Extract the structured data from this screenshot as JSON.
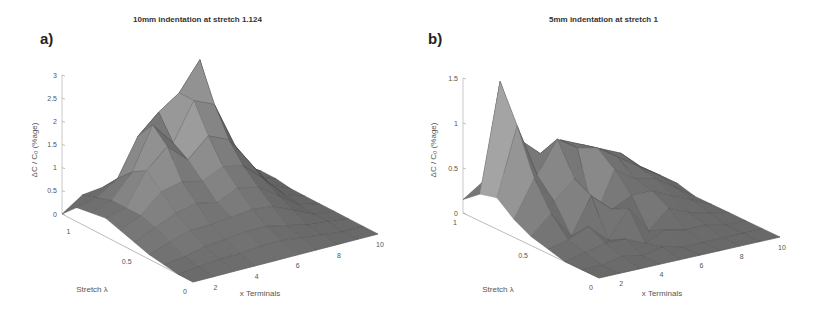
{
  "figure": {
    "panels": [
      {
        "label": "a)",
        "title": "10mm indentation at stretch 1.124",
        "zlabel": "ΔC / C₀ (%age)",
        "xlabel": "x Terminals",
        "ylabel": "Stretch λ"
      },
      {
        "label": "b)",
        "title": "5mm indentation at stretch 1",
        "zlabel": "ΔC / C₀ (%age)",
        "xlabel": "x Terminals",
        "ylabel": "Stretch λ"
      }
    ]
  },
  "chart_data": [
    {
      "type": "surface",
      "title": "10mm indentation at stretch 1.124",
      "panel_label": "a)",
      "xlabel": "x Terminals",
      "ylabel": "Stretch λ",
      "zlabel": "ΔC / C0 (%age)",
      "x_ticks": [
        2,
        4,
        6,
        8,
        10
      ],
      "y_ticks": [
        0,
        0.5,
        1
      ],
      "z_ticks": [
        0,
        0.5,
        1,
        1.5,
        2,
        2.5,
        3
      ],
      "xlim": [
        1,
        10
      ],
      "ylim": [
        0,
        1.124
      ],
      "zlim": [
        0,
        3
      ],
      "grid": false,
      "shading": "grayscale faceted",
      "x": [
        1,
        2,
        3,
        4,
        5,
        6,
        7,
        8,
        9,
        10
      ],
      "y": [
        1.124,
        1.0,
        0.875,
        0.75,
        0.625,
        0.5,
        0.375,
        0.25,
        0.125,
        0
      ],
      "z": [
        [
          0.0,
          0.3,
          0.35,
          0.4,
          0.5,
          0.6,
          0.5,
          0.3,
          0.15,
          0.0
        ],
        [
          0.3,
          0.4,
          0.7,
          1.5,
          1.9,
          2.2,
          2.8,
          1.2,
          0.3,
          0.05
        ],
        [
          0.35,
          0.5,
          1.0,
          1.9,
          1.4,
          2.2,
          2.0,
          1.0,
          0.2,
          0.05
        ],
        [
          0.4,
          0.5,
          1.2,
          1.6,
          1.2,
          1.6,
          1.4,
          0.8,
          0.2,
          0.0
        ],
        [
          0.3,
          0.5,
          0.9,
          1.0,
          0.9,
          1.1,
          1.0,
          0.6,
          0.15,
          0.0
        ],
        [
          0.2,
          0.4,
          0.6,
          0.7,
          0.6,
          0.8,
          0.7,
          0.4,
          0.1,
          0.0
        ],
        [
          0.1,
          0.25,
          0.4,
          0.4,
          0.45,
          0.5,
          0.45,
          0.25,
          0.05,
          0.0
        ],
        [
          0.05,
          0.1,
          0.2,
          0.25,
          0.3,
          0.3,
          0.2,
          0.1,
          0.05,
          0.0
        ],
        [
          0.0,
          0.05,
          0.1,
          0.1,
          0.15,
          0.15,
          0.1,
          0.05,
          0.0,
          0.0
        ],
        [
          0.0,
          0.0,
          0.0,
          0.0,
          0.0,
          0.0,
          0.0,
          0.0,
          0.0,
          0.0
        ]
      ]
    },
    {
      "type": "surface",
      "title": "5mm indentation at stretch 1",
      "panel_label": "b)",
      "xlabel": "x Terminals",
      "ylabel": "Stretch λ",
      "zlabel": "ΔC / C0 (%age)",
      "x_ticks": [
        2,
        4,
        6,
        8,
        10
      ],
      "y_ticks": [
        0,
        0.5,
        1
      ],
      "z_ticks": [
        0,
        0.5,
        1,
        1.5
      ],
      "xlim": [
        1,
        10
      ],
      "ylim": [
        0,
        1
      ],
      "zlim": [
        0,
        1.5
      ],
      "grid": false,
      "shading": "grayscale faceted",
      "x": [
        1,
        2,
        3,
        4,
        5,
        6,
        7,
        8,
        9,
        10
      ],
      "y": [
        1.0,
        0.875,
        0.75,
        0.625,
        0.5,
        0.375,
        0.25,
        0.125,
        0
      ],
      "z": [
        [
          0.15,
          0.3,
          0.35,
          0.3,
          0.3,
          0.25,
          0.2,
          0.15,
          0.1,
          0.0
        ],
        [
          0.3,
          1.5,
          0.8,
          0.6,
          0.7,
          0.6,
          0.5,
          0.4,
          0.2,
          0.05
        ],
        [
          0.35,
          1.1,
          0.5,
          0.85,
          0.7,
          0.65,
          0.5,
          0.35,
          0.2,
          0.05
        ],
        [
          0.2,
          0.6,
          0.3,
          0.5,
          0.0,
          0.5,
          0.35,
          0.3,
          0.15,
          0.0
        ],
        [
          0.1,
          0.3,
          0.0,
          0.4,
          0.2,
          0.3,
          0.3,
          0.2,
          0.1,
          0.0
        ],
        [
          0.05,
          0.1,
          0.2,
          0.0,
          0.3,
          0.0,
          0.2,
          0.1,
          0.05,
          0.0
        ],
        [
          0.0,
          0.05,
          0.1,
          0.1,
          0.0,
          0.1,
          0.05,
          0.05,
          0.0,
          0.0
        ],
        [
          0.0,
          0.0,
          0.05,
          0.0,
          0.05,
          0.0,
          0.0,
          0.0,
          0.0,
          0.0
        ],
        [
          0.0,
          0.0,
          0.0,
          0.0,
          0.0,
          0.0,
          0.0,
          0.0,
          0.0,
          0.0
        ]
      ]
    }
  ],
  "geometry": [
    {
      "origin": [
        62,
        214
      ],
      "y0_corner": [
        193,
        282
      ],
      "x10_corner": [
        378,
        234
      ],
      "z_top": [
        62,
        75
      ]
    },
    {
      "origin": [
        463,
        213
      ],
      "y0_corner": [
        599,
        278
      ],
      "x10_corner": [
        780,
        237
      ],
      "z_top": [
        463,
        78
      ]
    }
  ]
}
